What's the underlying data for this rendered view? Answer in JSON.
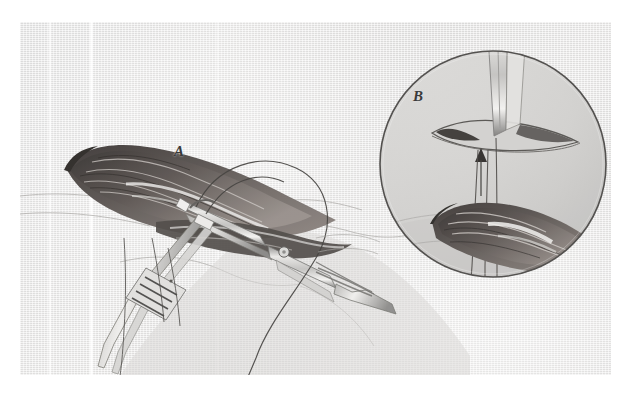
{
  "figure": {
    "domain": "medical-surgical-illustration",
    "title": "",
    "caption": "",
    "background_color": "#ffffff",
    "plate_color": "#dedede",
    "ink_color": "#3a3a3a",
    "tissue_dark_color": "#474241",
    "instrument_color": "#b9b8b6"
  },
  "labels": [
    {
      "id": "A",
      "text": "A",
      "x": 180,
      "y": 152,
      "description": "main-operative-field-label"
    },
    {
      "id": "B",
      "text": "B",
      "x": 420,
      "y": 98,
      "description": "magnified-inset-label"
    }
  ],
  "inset": {
    "shape": "circle",
    "center_x": 493,
    "center_y": 164,
    "radius": 114,
    "label": "B"
  },
  "elements": [
    {
      "name": "dissected-tissue-flap",
      "type": "anatomy"
    },
    {
      "name": "surgical-forceps",
      "type": "instrument"
    },
    {
      "name": "needle-holder",
      "type": "instrument"
    },
    {
      "name": "ratchet-handle",
      "type": "instrument-detail"
    },
    {
      "name": "suture-thread-loop",
      "type": "suture"
    },
    {
      "name": "suture-needle",
      "type": "suture"
    },
    {
      "name": "incision-slit",
      "type": "anatomy"
    },
    {
      "name": "arrow-marker",
      "type": "annotation"
    },
    {
      "name": "scan-fold-streaks",
      "type": "artifact"
    }
  ]
}
